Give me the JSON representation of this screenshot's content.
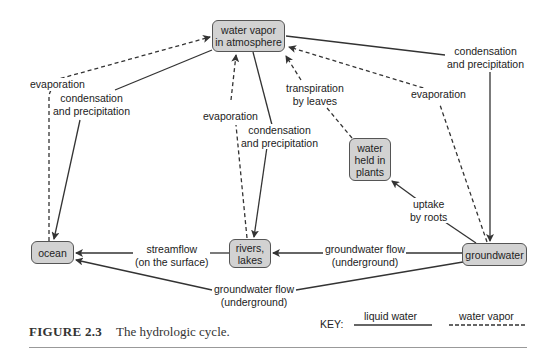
{
  "nodes": {
    "water_vapor": "water vapor\nin atmosphere",
    "plants": "water\nheld in\nplants",
    "ocean": "ocean",
    "rivers_lakes": "rivers,\nlakes",
    "groundwater": "groundwater"
  },
  "labels": {
    "ocean_evaporation": "evaporation",
    "ocean_condensation": "condensation\nand precipitation",
    "rivers_evaporation": "evaporation",
    "rivers_condensation": "condensation\nand precipitation",
    "transpiration": "transpiration\nby leaves",
    "groundwater_evaporation": "evaporation",
    "groundwater_condensation": "condensation\nand precipitation",
    "uptake": "uptake\nby roots",
    "streamflow": "streamflow\n(on the surface)",
    "gw_flow_rivers": "groundwater flow\n(underground)",
    "gw_flow_ocean": "groundwater flow\n(underground)"
  },
  "key": {
    "title": "KEY:",
    "liquid": "liquid water",
    "vapor": "water vapor"
  },
  "caption": {
    "number": "FIGURE 2.3",
    "text": "The hydrologic cycle."
  },
  "colors": {
    "node_fill": "#d2d2d2",
    "stroke": "#333333"
  }
}
